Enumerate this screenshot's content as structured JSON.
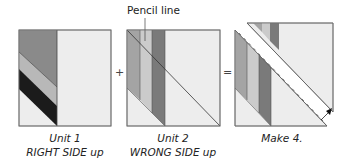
{
  "colors": {
    "outline": "#707070",
    "background_fabric": "#ededed",
    "dark_gray": "#8a8a8a",
    "medium_gray": "#a4a4a4",
    "light_gray": "#c6c6c6",
    "black": "#1b1b1b",
    "strip_dark": "#7a7a7a",
    "white": "#ffffff"
  },
  "callout": {
    "label": "Pencil line"
  },
  "operators": {
    "plus": "+",
    "equals": "="
  },
  "units": [
    {
      "id": "unit1",
      "title": "Unit 1",
      "subtitle": "RIGHT SIDE up"
    },
    {
      "id": "unit2",
      "title": "Unit 2",
      "subtitle": "WRONG SIDE up"
    },
    {
      "id": "result",
      "title": "Make 4.",
      "subtitle": ""
    }
  ]
}
